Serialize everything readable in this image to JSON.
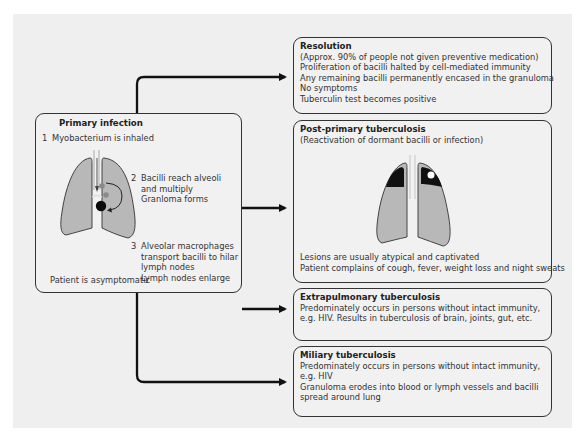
{
  "primary": {
    "title": "Primary infection",
    "step1_num": "1",
    "step1": "Myobacterium is inhaled",
    "step2_num": "2",
    "step2_lines": [
      "Bacilli reach alveoli",
      "and multiply",
      "Granloma forms"
    ],
    "step3_num": "3",
    "step3_lines": [
      "Alveolar macrophages",
      "transport bacilli to hilar",
      "lymph nodes",
      "Lymph nodes enlarge"
    ],
    "footer": "Patient is asymptomatic"
  },
  "resolution": {
    "title": "Resolution",
    "lines": [
      "(Approx. 90% of people not given preventive medication)",
      "Proliferation of bacilli halted by cell-mediated immunity",
      "Any remaining bacilli permanently encased in the granuloma",
      "No symptoms",
      "Tuberculin test becomes positive"
    ]
  },
  "postprimary": {
    "title": "Post-primary tuberculosis",
    "subtitle": "(Reactivation of dormant bacilli or infection)",
    "lines": [
      "Lesions are usually atypical and captivated",
      "Patient complains of cough, fever, weight loss and night sweats"
    ]
  },
  "extrapulmonary": {
    "title": "Extrapulmonary tuberculosis",
    "lines": [
      "Predominately occurs in persons without intact immunity,",
      "e.g. HIV. Results in tuberculosis of brain, joints, gut, etc."
    ]
  },
  "miliary": {
    "title": "Miliary tuberculosis",
    "lines": [
      "Predominately occurs in persons without intact immunity,",
      "e.g. HIV",
      "Granuloma erodes into blood or lymph vessels and bacilli",
      "spread around lung"
    ]
  },
  "colors": {
    "lung_fill": "#b5b5b5",
    "lesion": "#111111",
    "line": "#111111",
    "panel": "#efefef"
  }
}
